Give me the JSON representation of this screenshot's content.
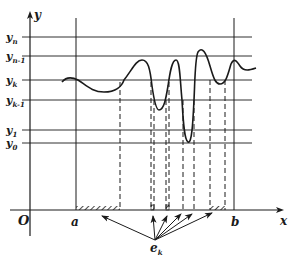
{
  "diagram": {
    "axes": {
      "x_label": "x",
      "y_label": "y",
      "origin_label": "O"
    },
    "y_levels": [
      {
        "label": "y",
        "sub": "n"
      },
      {
        "label": "y",
        "sub": "n-1"
      },
      {
        "label": "y",
        "sub": "k"
      },
      {
        "label": "y",
        "sub": "k-1"
      },
      {
        "label": "y",
        "sub": "1"
      },
      {
        "label": "y",
        "sub": "0"
      }
    ],
    "x_bounds": {
      "a": "a",
      "b": "b"
    },
    "set_label": {
      "main": "e",
      "sub": "k"
    },
    "colors": {
      "ink": "#1a1a1a",
      "background": "#ffffff"
    }
  }
}
